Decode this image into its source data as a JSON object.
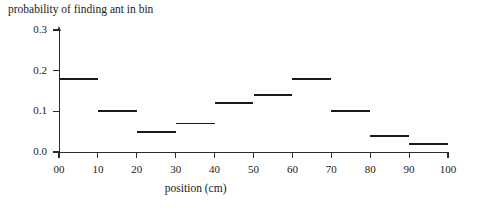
{
  "chart_data": {
    "type": "bar",
    "title": "probability of finding ant in bin",
    "xlabel": "position (cm)",
    "ylabel": "",
    "categories": [
      "00-10",
      "10-20",
      "20-30",
      "30-40",
      "40-50",
      "50-60",
      "60-70",
      "70-80",
      "80-90",
      "90-100"
    ],
    "bin_edges": [
      0,
      10,
      20,
      30,
      40,
      50,
      60,
      70,
      80,
      90,
      100
    ],
    "values": [
      0.18,
      0.1,
      0.05,
      0.07,
      0.12,
      0.14,
      0.18,
      0.1,
      0.04,
      0.02
    ],
    "xlim": [
      0,
      100
    ],
    "ylim": [
      0.0,
      0.3
    ],
    "x_ticks": [
      "00",
      "10",
      "20",
      "30",
      "40",
      "50",
      "60",
      "70",
      "80",
      "90",
      "100"
    ],
    "x_tick_values": [
      0,
      10,
      20,
      30,
      40,
      50,
      60,
      70,
      80,
      90,
      100
    ],
    "y_ticks": [
      "0.0",
      "0.1",
      "0.2",
      "0.3"
    ],
    "y_tick_values": [
      0.0,
      0.1,
      0.2,
      0.3
    ],
    "grid": false,
    "legend": "none",
    "line_color": "#1a1a1a",
    "axis_color": "#2b2b2b",
    "background": "#ffffff"
  }
}
